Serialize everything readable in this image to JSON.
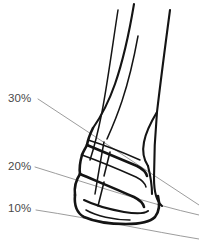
{
  "figure": {
    "background_color": "#ffffff",
    "ink_color": "#141414",
    "guide_color": "#8a8a8a",
    "label_color": "#4a4a4a"
  },
  "labels": [
    {
      "id": "pct-30",
      "text": "30%",
      "x": 8,
      "y": 102
    },
    {
      "id": "pct-20",
      "text": "20%",
      "x": 8,
      "y": 170
    },
    {
      "id": "pct-10",
      "text": "10%",
      "x": 8,
      "y": 212
    }
  ],
  "guides": [
    {
      "id": "guide-30",
      "label": "30%",
      "path": "M 38 99 L 199 205"
    },
    {
      "id": "guide-20",
      "label": "20%",
      "path": "M 35 167 C 90 184 150 204 199 215"
    },
    {
      "id": "guide-10",
      "label": "10%",
      "path": "M 36 210 C 95 219 150 231 199 239"
    }
  ],
  "anatomy": {
    "cannon_outer_front": "M 134 4 C 130 28 124 58 115 84 C 108 104 100 118 93 128",
    "cannon_inner_front": "M 138 36 C 134 58 129 80 122 101 C 116 119 111 130 107 139",
    "cannon_back": "M 170 10 C 166 40 161 78 157 112 C 155 134 154 156 154 178 C 154 192 156 201 162 206",
    "fetlock_bulge": "M 157 112 C 151 122 146 131 144 142 C 142 152 144 160 148 166",
    "pastern_front_upper": "M 93 128 C 90 134 88 139 87 145",
    "segment1": "M 87 145 C 99 150 118 158 137 166 C 143 169 146 172 147 176",
    "segment1_top": "M 88 140 C 101 144 122 152 140 160",
    "segment2_outer": "M 82 155 C 80 162 79 168 80 174",
    "segment2_bottom": "M 80 174 C 94 180 116 189 134 197 C 140 200 143 203 144 207",
    "segment2_top": "M 82 155 C 96 160 118 169 136 177 C 142 180 145 183 146 187",
    "hoof_outer": "M 80 174 C 76 180 74 187 75 195",
    "hoof_wall": "M 75 195 C 74 205 77 213 84 217 C 93 221 110 224 126 224 C 140 224 150 222 155 217 C 159 212 160 204 158 196",
    "hoof_inner": "M 84 200 C 92 204 108 209 124 212 C 136 214 144 214 148 211",
    "hoof_sole": "M 86 210 C 96 216 114 220 130 220",
    "bone_line_a": "M 118 10 C 113 42 108 80 102 112 C 98 132 94 148 90 160",
    "bone_line_b": "M 104 142 C 101 158 98 176 95 194",
    "joint_crease1": "M 110 152 C 108 160 106 168 104 176",
    "joint_crease2": "M 104 182 C 102 190 100 198 98 206",
    "coronet_fold": "M 87 145 C 85 149 83 152 82 155",
    "heel_bulb": "M 148 166 C 150 174 152 184 152 194"
  }
}
